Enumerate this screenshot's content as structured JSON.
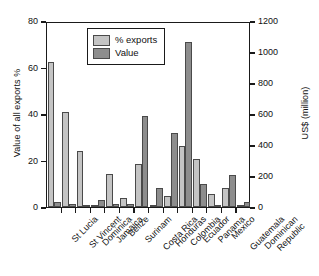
{
  "chart_data": {
    "type": "bar",
    "title": "",
    "subtitle": "",
    "xlabel": "",
    "ylabel": "Value of all exports %",
    "y2label": "US$ (million)",
    "ylim": [
      0,
      80
    ],
    "y2lim": [
      0,
      1200
    ],
    "yticks": [
      "0",
      "20",
      "40",
      "60",
      "80"
    ],
    "ytick_values": [
      0,
      20,
      40,
      60,
      80
    ],
    "y2ticks": [
      "0",
      "200",
      "400",
      "600",
      "800",
      "1000",
      "1200"
    ],
    "y2tick_values": [
      0,
      200,
      400,
      600,
      800,
      1000,
      1200
    ],
    "grid": false,
    "legend_position": "upper center",
    "categories": [
      "St Lucia",
      "St Vincent",
      "Dominica",
      "Jamaica",
      "Belize",
      "Surinam",
      "Costa Rica",
      "Honduras",
      "Colombia",
      "Ecuador",
      "Panama",
      "Mexico",
      "Guatemala",
      "Dominican Republic"
    ],
    "category_lines": [
      [
        "St Lucia"
      ],
      [
        "St Vincent"
      ],
      [
        "Dominica"
      ],
      [
        "Jamaica"
      ],
      [
        "Belize"
      ],
      [
        "Surinam"
      ],
      [
        "Costa Rica"
      ],
      [
        "Honduras"
      ],
      [
        "Colombia"
      ],
      [
        "Ecuador"
      ],
      [
        "Panama"
      ],
      [
        "Mexico"
      ],
      [
        "Guatemala"
      ],
      [
        "Dominican",
        "Republic"
      ]
    ],
    "series": [
      {
        "name": "% exports",
        "axis": "left",
        "unit": "%",
        "color": "#c4c4c4",
        "values": [
          62.2,
          40.8,
          23.9,
          0.9,
          14.3,
          3.9,
          18.4,
          0.5,
          4.9,
          26.1,
          20.6,
          5.7,
          8.3,
          0.4
        ]
      },
      {
        "name": "Value",
        "axis": "right",
        "unit": "US$ (million)",
        "color": "#8d8d8d",
        "values": [
          30,
          21,
          12,
          43,
          22,
          21,
          585,
          125,
          480,
          1065,
          150,
          0,
          205,
          32
        ]
      }
    ],
    "value_series_in_left_units": [
      2.0,
      1.4,
      0.8,
      2.9,
      1.5,
      1.4,
      39.0,
      8.3,
      32.0,
      71.0,
      10.0,
      0.0,
      13.7,
      2.1
    ]
  },
  "legend": {
    "items": [
      {
        "label": "% exports",
        "swatch": "pct"
      },
      {
        "label": "Value",
        "swatch": "value"
      }
    ]
  }
}
